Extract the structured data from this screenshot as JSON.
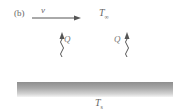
{
  "diagram": {
    "panel_label": "(b)",
    "velocity_label": "v",
    "ambient_temperature": {
      "symbol": "T",
      "subscript": "∞"
    },
    "surface_temperature": {
      "symbol": "T",
      "subscript": "s"
    },
    "heat_flux_labels": [
      "Q",
      "Q"
    ],
    "elements": [
      {
        "type": "arrow",
        "direction": "right",
        "label": "v",
        "meaning": "flow velocity"
      },
      {
        "type": "wavy-arrow",
        "direction": "up",
        "label": "Q",
        "meaning": "heat transfer"
      },
      {
        "type": "wavy-arrow",
        "direction": "up",
        "label": "Q",
        "meaning": "heat transfer"
      },
      {
        "type": "plate",
        "label": "T_s",
        "meaning": "heated surface"
      }
    ],
    "colors": {
      "line": "#555555",
      "plate_dark": "#8e8e8e",
      "plate_light": "#f4f4f4",
      "background": "#ffffff"
    }
  }
}
